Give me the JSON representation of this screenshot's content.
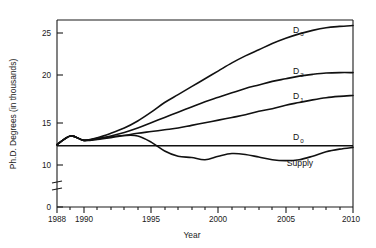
{
  "chart_data": {
    "type": "line",
    "title": "",
    "xlabel": "Year",
    "ylabel": "Ph.D. Degrees (in thousands)",
    "xlim": [
      1988,
      2010
    ],
    "ylim": [
      0,
      27
    ],
    "y_axis_break": {
      "between": [
        0,
        10
      ],
      "note": "broken axis between 0 and 10"
    },
    "grid": false,
    "legend": "inline-right-labels",
    "xticks": [
      "1988",
      "1990",
      "1995",
      "2000",
      "2005",
      "2010"
    ],
    "xtick_values": [
      1988,
      1990,
      1995,
      2000,
      2005,
      2010
    ],
    "yticks": [
      "0",
      "10",
      "15",
      "20",
      "25"
    ],
    "ytick_values": [
      0,
      10,
      15,
      20,
      25
    ],
    "x": [
      1988,
      1989,
      1990,
      1991,
      1992,
      1993,
      1994,
      1995,
      1996,
      1997,
      1998,
      1999,
      2000,
      2001,
      2002,
      2003,
      2004,
      2005,
      2006,
      2007,
      2008,
      2009,
      2010
    ],
    "series": [
      {
        "name": "D3",
        "label": "D",
        "subscript": "3",
        "values": [
          12.3,
          13.3,
          12.8,
          13.1,
          13.6,
          14.2,
          15.0,
          16.0,
          17.1,
          18.0,
          18.9,
          19.8,
          20.7,
          21.6,
          22.4,
          23.1,
          23.8,
          24.4,
          24.9,
          25.3,
          25.6,
          25.75,
          25.85
        ]
      },
      {
        "name": "D2",
        "label": "D",
        "subscript": "2",
        "values": [
          12.3,
          13.3,
          12.8,
          13.0,
          13.3,
          13.7,
          14.2,
          14.8,
          15.4,
          16.0,
          16.6,
          17.2,
          17.7,
          18.2,
          18.7,
          19.1,
          19.5,
          19.8,
          20.1,
          20.3,
          20.45,
          20.5,
          20.5
        ]
      },
      {
        "name": "D1",
        "label": "D",
        "subscript": "1",
        "values": [
          12.3,
          13.3,
          12.8,
          12.9,
          13.1,
          13.35,
          13.6,
          13.8,
          14.0,
          14.2,
          14.5,
          14.8,
          15.1,
          15.4,
          15.7,
          16.1,
          16.4,
          16.8,
          17.1,
          17.4,
          17.65,
          17.8,
          17.9
        ]
      },
      {
        "name": "D0",
        "label": "D",
        "subscript": "0",
        "values": [
          12.2,
          12.2,
          12.2,
          12.2,
          12.2,
          12.2,
          12.2,
          12.2,
          12.2,
          12.2,
          12.2,
          12.2,
          12.2,
          12.2,
          12.2,
          12.2,
          12.2,
          12.2,
          12.2,
          12.2,
          12.2,
          12.2,
          12.2
        ]
      },
      {
        "name": "Supply",
        "label": "Supply",
        "subscript": "",
        "values": [
          12.3,
          13.3,
          12.8,
          13.0,
          13.2,
          13.35,
          13.3,
          12.6,
          11.6,
          11.0,
          10.85,
          10.6,
          11.0,
          11.3,
          11.2,
          10.9,
          10.6,
          10.5,
          10.6,
          11.0,
          11.5,
          11.8,
          12.0
        ]
      }
    ]
  },
  "labels": {
    "ylabel": "Ph.D. Degrees (in thousands)",
    "xlabel": "Year",
    "d3": "D",
    "d3_sub": "3",
    "d2": "D",
    "d2_sub": "2",
    "d1": "D",
    "d1_sub": "1",
    "d0": "D",
    "d0_sub": "0",
    "supply": "Supply",
    "x0": "1988",
    "x1": "1990",
    "x2": "1995",
    "x3": "2000",
    "x4": "2005",
    "x5": "2010",
    "y0": "0",
    "y10": "10",
    "y15": "15",
    "y20": "20",
    "y25": "25"
  },
  "colors": {
    "line": "#111111",
    "axis": "#1a1a1a",
    "background": "#ffffff"
  }
}
